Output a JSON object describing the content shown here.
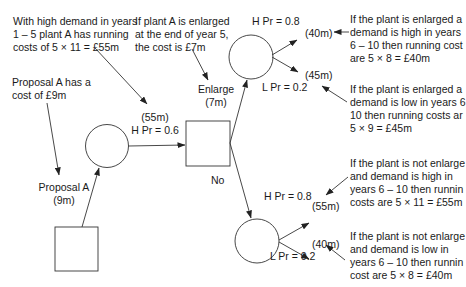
{
  "diagram": {
    "type": "decision-tree",
    "nodes": {
      "start_decision": {
        "shape": "square"
      },
      "chance_1": {
        "shape": "circle"
      },
      "decision_2": {
        "shape": "square"
      },
      "chance_enlarge": {
        "shape": "circle"
      },
      "chance_no_enlarge": {
        "shape": "circle"
      }
    },
    "labels": {
      "proposal_a_cost_note": "Proposal A has a\ncost of £9m",
      "proposal_a": "Proposal A\n(9m)",
      "high_demand_note": "With high demand in years\n1 – 5 plant A has running\ncosts of 5 × 11 = £55m",
      "branch_1_value": "(55m)",
      "branch_1_prob": "H Pr = 0.6",
      "enlarge_note": "If plant A is enlarged\nat the end of year 5,\nthe cost is £7m",
      "enlarge": "Enlarge\n(7m)",
      "no": "No",
      "enlarge_high_prob": "H Pr = 0.8",
      "enlarge_high_value": "(40m)",
      "enlarge_low_value": "(45m)",
      "enlarge_low_prob": "L Pr = 0.2",
      "no_high_prob": "H Pr = 0.8",
      "no_high_value": "(55m)",
      "no_low_value": "(40m)",
      "no_low_prob": "L Pr = 0.2",
      "note_enlarged_high": "If the plant is enlarged a\ndemand is high in years\n6 – 10 then running cost\nare 5 × 8 = £40m",
      "note_enlarged_low": "If the plant is enlarged a\ndemand is low in years 6\n10 then running costs ar\n5 × 9 = £45m",
      "note_not_enlarged_high": "If the plant is not enlarge\nand demand is high in\nyears 6 – 10 then runnin\ncosts are 5 × 11 = £55m",
      "note_not_enlarged_low": "If the plant is not enlarge\nand demand is low in\nyears 6 – 10 then runnin\ncost are 5 × 8 = £40m"
    },
    "colors": {
      "line": "#333333",
      "text": "#1a1a1a",
      "background": "#ffffff"
    }
  }
}
